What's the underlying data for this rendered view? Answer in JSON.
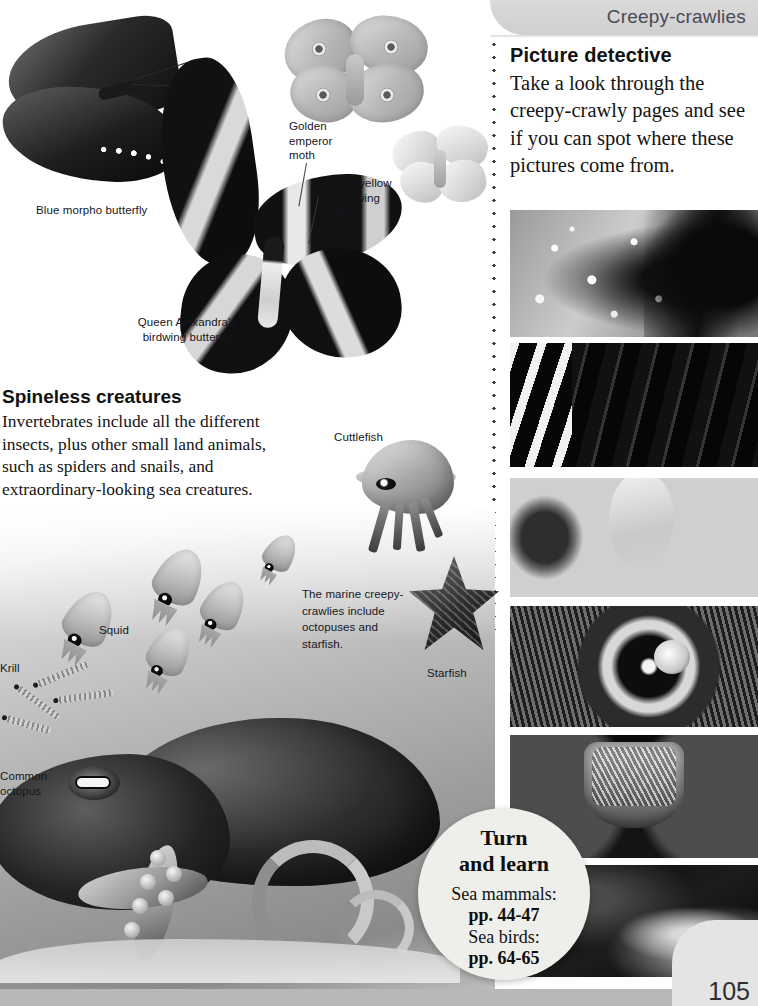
{
  "header": {
    "chapter_title": "Creepy-crawlies"
  },
  "picture_detective": {
    "heading": "Picture detective",
    "body": "Take a look through the creepy-crawly pages and see if you can spot where these pictures come from."
  },
  "spineless": {
    "heading": "Spineless creatures",
    "body": "Invertebrates include all the different insects, plus other small land animals, such as spiders and snails, and extraordinary-looking sea creatures."
  },
  "labels": {
    "blue_morpho": "Blue morpho butterfly",
    "golden_emperor": "Golden emperor moth",
    "large_yellow": "Large yellow underwing moth",
    "queen_alexandra": "Queen Alexandra's birdwing butterfly",
    "cuttlefish": "Cuttlefish",
    "squid": "Squid",
    "krill": "Krill",
    "common_octopus": "Common octopus",
    "starfish": "Starfish",
    "marine_caption": "The marine creepy-crawlies include octopuses and starfish."
  },
  "turn_and_learn": {
    "title_line1": "Turn",
    "title_line2": "and learn",
    "entry1_label": "Sea mammals:",
    "entry1_pages": "pp. 44-47",
    "entry2_label": "Sea birds:",
    "entry2_pages": "pp. 64-65"
  },
  "footer": {
    "page_number": "105"
  },
  "icons": {
    "dotted_divider": "dotted-divider-icon"
  },
  "colors": {
    "header_band": "#d4d4d4",
    "header_text": "#4a4a55",
    "turn_circle": "#eeeeea",
    "bottom_bar": "#b8b8b8",
    "body_text": "#141414"
  }
}
